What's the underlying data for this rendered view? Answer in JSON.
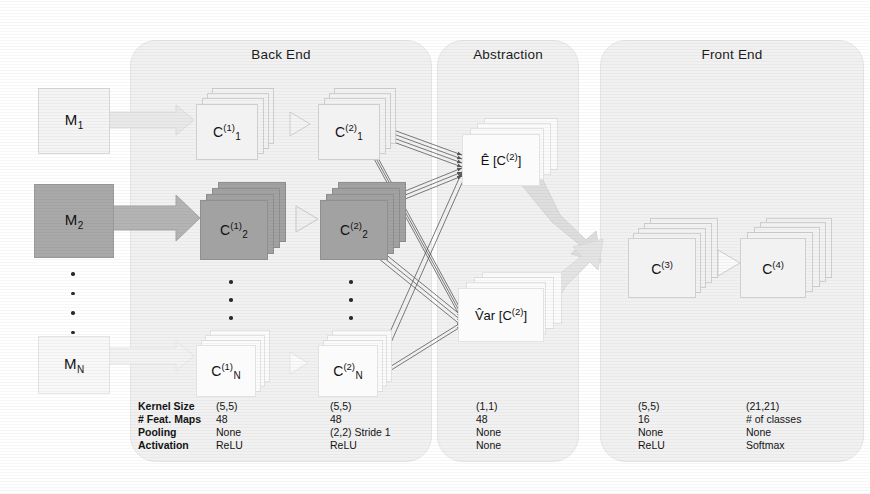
{
  "panels": [
    {
      "id": "back-end",
      "title": "Back End"
    },
    {
      "id": "abstraction",
      "title": "Abstraction"
    },
    {
      "id": "front-end",
      "title": "Front End"
    }
  ],
  "inputs": [
    {
      "id": "m1",
      "base": "M",
      "sub": "1",
      "shade": "light"
    },
    {
      "id": "m2",
      "base": "M",
      "sub": "2",
      "shade": "dark"
    },
    {
      "id": "mn",
      "base": "M",
      "sub": "N",
      "shade": "light"
    }
  ],
  "backend": {
    "layer1": [
      {
        "id": "c1-1",
        "base": "C",
        "sub": "1",
        "sup": "(1)",
        "shade": "light"
      },
      {
        "id": "c2-1",
        "base": "C",
        "sub": "2",
        "sup": "(1)",
        "shade": "dark"
      },
      {
        "id": "cn-1",
        "base": "C",
        "sub": "N",
        "sup": "(1)",
        "shade": "faint"
      }
    ],
    "layer2": [
      {
        "id": "c1-2",
        "base": "C",
        "sub": "1",
        "sup": "(2)",
        "shade": "light"
      },
      {
        "id": "c2-2",
        "base": "C",
        "sub": "2",
        "sup": "(2)",
        "shade": "dark"
      },
      {
        "id": "cn-2",
        "base": "C",
        "sub": "N",
        "sup": "(2)",
        "shade": "faint"
      }
    ]
  },
  "abstraction": {
    "nodes": [
      {
        "id": "expectation",
        "label": "Ê [C",
        "sup": "(2)",
        "tail": "]"
      },
      {
        "id": "variance",
        "label": "V̂ar [C",
        "sup": "(2)",
        "tail": "]"
      }
    ],
    "expectation_text": "Ê[C⁽²⁾]",
    "variance_text": "V̂ar[C⁽²⁾]"
  },
  "frontend": {
    "blocks": [
      {
        "id": "c3",
        "base": "C",
        "sup": "(3)",
        "shade": "light"
      },
      {
        "id": "c4",
        "base": "C",
        "sup": "(4)",
        "shade": "light"
      }
    ]
  },
  "ellipsis": {
    "dot_count": 4
  },
  "param_table": {
    "row_labels": [
      "Kernel Size",
      "# Feat. Maps",
      "Pooling",
      "Activation"
    ],
    "columns": [
      {
        "id": "col-c1",
        "values": [
          "(5,5)",
          "48",
          "None",
          "ReLU"
        ]
      },
      {
        "id": "col-c2",
        "values": [
          "(5,5)",
          "48",
          "(2,2) Stride 1",
          "ReLU"
        ]
      },
      {
        "id": "col-abs",
        "values": [
          "(1,1)",
          "48",
          "None",
          "None"
        ]
      },
      {
        "id": "col-c3",
        "values": [
          "(5,5)",
          "16",
          "None",
          "ReLU"
        ]
      },
      {
        "id": "col-c4",
        "values": [
          "(21,21)",
          "# of classes",
          "None",
          "Softmax"
        ]
      }
    ]
  },
  "colors": {
    "panel_bg": "#f1f1f1",
    "light_block": "#f2f2f2",
    "dark_block": "#a2a2a2",
    "faint_block": "#fbfbfb",
    "arrow_fill": "#d9d9d9",
    "thin_arrow": "#555555",
    "text": "#1a1a1a"
  }
}
